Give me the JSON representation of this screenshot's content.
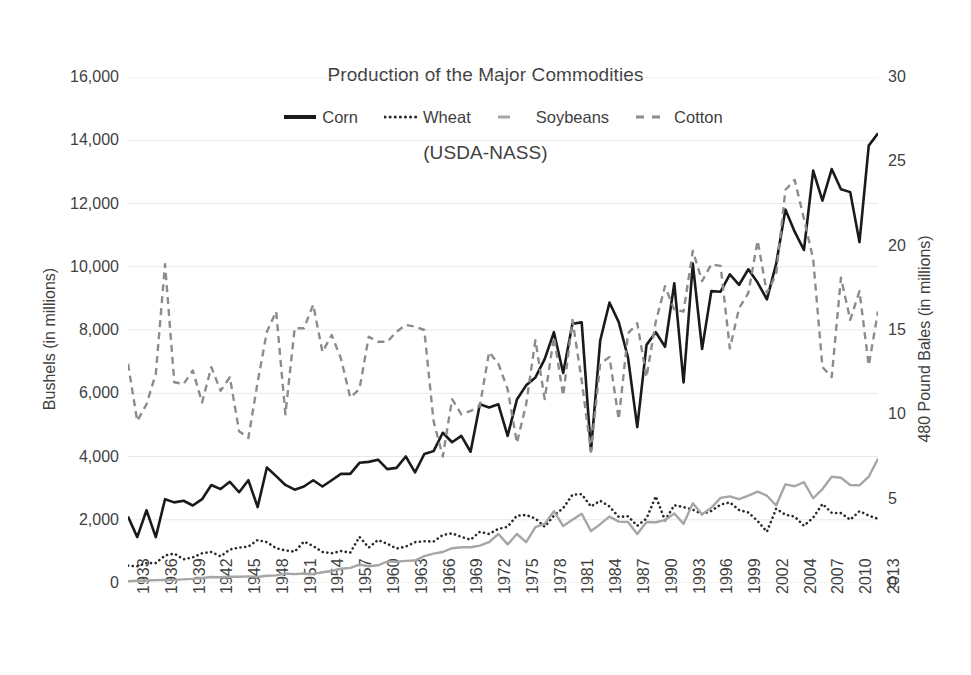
{
  "chart_data": {
    "type": "line",
    "title": "Production of the Major Commodities\n(USDA-NASS)",
    "title_line1": "Production of the Major Commodities",
    "title_line2": "(USDA-NASS)",
    "xlabel": "",
    "ylabel": "Bushels (in millions)",
    "y2label": "480 Pound Bales (in millions)",
    "ylim": [
      0,
      16000
    ],
    "y2lim": [
      0,
      30
    ],
    "yticks": [
      "0",
      "2,000",
      "4,000",
      "6,000",
      "8,000",
      "10,000",
      "12,000",
      "14,000",
      "16,000"
    ],
    "ytick_values": [
      0,
      2000,
      4000,
      6000,
      8000,
      10000,
      12000,
      14000,
      16000
    ],
    "y2ticks": [
      "0",
      "5",
      "10",
      "15",
      "20",
      "25",
      "30"
    ],
    "y2tick_values": [
      0,
      5,
      10,
      15,
      20,
      25,
      30
    ],
    "grid": true,
    "grid_color": "#e9e9e9",
    "legend_position": "top-center",
    "xlim": [
      1933,
      2014
    ],
    "xtick_labels": [
      "1933",
      "1936",
      "1939",
      "1942",
      "1945",
      "1948",
      "1951",
      "1954",
      "1957",
      "1960",
      "1963",
      "1966",
      "1969",
      "1972",
      "1975",
      "1978",
      "1981",
      "1984",
      "1987",
      "1990",
      "1993",
      "1996",
      "1999",
      "2002",
      "2004",
      "2007",
      "2010",
      "2013"
    ],
    "xtick_values": [
      1933,
      1936,
      1939,
      1942,
      1945,
      1948,
      1951,
      1954,
      1957,
      1960,
      1963,
      1966,
      1969,
      1972,
      1975,
      1978,
      1981,
      1984,
      1987,
      1990,
      1993,
      1996,
      1999,
      2002,
      2005,
      2008,
      2011,
      2014
    ],
    "x": [
      1933,
      1934,
      1935,
      1936,
      1937,
      1938,
      1939,
      1940,
      1941,
      1942,
      1943,
      1944,
      1945,
      1946,
      1947,
      1948,
      1949,
      1950,
      1951,
      1952,
      1953,
      1954,
      1955,
      1956,
      1957,
      1958,
      1959,
      1960,
      1961,
      1962,
      1963,
      1964,
      1965,
      1966,
      1967,
      1968,
      1969,
      1970,
      1971,
      1972,
      1973,
      1974,
      1975,
      1976,
      1977,
      1978,
      1979,
      1980,
      1981,
      1982,
      1983,
      1984,
      1985,
      1986,
      1987,
      1988,
      1989,
      1990,
      1991,
      1992,
      1993,
      1994,
      1995,
      1996,
      1997,
      1998,
      1999,
      2000,
      2001,
      2002,
      2003,
      2004,
      2005,
      2006,
      2007,
      2008,
      2009,
      2010,
      2011,
      2012,
      2013,
      2014
    ],
    "series": [
      {
        "name": "Corn",
        "axis": "left",
        "units": "Bushels (in millions)",
        "color": "#1a1a1a",
        "style": "solid",
        "width": 2.6,
        "values": [
          2100,
          1450,
          2300,
          1450,
          2650,
          2550,
          2600,
          2450,
          2650,
          3100,
          2970,
          3200,
          2870,
          3250,
          2400,
          3650,
          3380,
          3100,
          2950,
          3050,
          3250,
          3050,
          3250,
          3450,
          3450,
          3800,
          3830,
          3900,
          3600,
          3640,
          4000,
          3500,
          4080,
          4170,
          4750,
          4450,
          4650,
          4150,
          5650,
          5550,
          5650,
          4650,
          5800,
          6250,
          6500,
          7080,
          7930,
          6640,
          8200,
          8240,
          4170,
          7670,
          8870,
          8250,
          7130,
          4930,
          7530,
          7930,
          7470,
          9480,
          6340,
          10100,
          7400,
          9230,
          9210,
          9760,
          9430,
          9920,
          9500,
          8970,
          10090,
          11810,
          11110,
          10530,
          13040,
          12090,
          13090,
          12450,
          12360,
          10780,
          13830,
          14220
        ]
      },
      {
        "name": "Wheat",
        "axis": "left",
        "units": "Bushels (in millions)",
        "color": "#2a2a2a",
        "style": "dotted",
        "width": 2.6,
        "values": [
          550,
          530,
          630,
          630,
          870,
          930,
          750,
          810,
          940,
          980,
          840,
          1060,
          1120,
          1150,
          1360,
          1290,
          1100,
          1030,
          990,
          1310,
          1170,
          980,
          940,
          1010,
          960,
          1460,
          1120,
          1360,
          1240,
          1090,
          1150,
          1290,
          1320,
          1310,
          1520,
          1570,
          1460,
          1370,
          1620,
          1550,
          1710,
          1780,
          2130,
          2150,
          2040,
          1780,
          2130,
          2370,
          2790,
          2810,
          2420,
          2600,
          2420,
          2090,
          2110,
          1810,
          2040,
          2740,
          1980,
          2460,
          2400,
          2320,
          2180,
          2280,
          2480,
          2550,
          2310,
          2230,
          1960,
          1620,
          2350,
          2160,
          2100,
          1810,
          2070,
          2500,
          2220,
          2210,
          2000,
          2270,
          2130,
          2030
        ]
      },
      {
        "name": "Soybeans",
        "axis": "left",
        "units": "Bushels (in millions)",
        "color": "#a6a6a6",
        "style": "solid-light",
        "width": 2.4,
        "values": [
          55,
          70,
          80,
          90,
          95,
          100,
          115,
          130,
          160,
          190,
          180,
          200,
          200,
          210,
          190,
          230,
          240,
          300,
          280,
          300,
          280,
          340,
          380,
          450,
          480,
          580,
          530,
          560,
          680,
          670,
          700,
          710,
          850,
          930,
          980,
          1100,
          1130,
          1130,
          1180,
          1290,
          1550,
          1220,
          1550,
          1290,
          1770,
          1870,
          2270,
          1800,
          2000,
          2190,
          1640,
          1860,
          2100,
          1940,
          1930,
          1550,
          1930,
          1920,
          1990,
          2200,
          1870,
          2520,
          2170,
          2380,
          2690,
          2740,
          2650,
          2760,
          2890,
          2760,
          2450,
          3120,
          3060,
          3190,
          2680,
          2970,
          3360,
          3330,
          3100,
          3090,
          3360,
          3930
        ]
      },
      {
        "name": "Cotton",
        "axis": "right",
        "units": "480 Pound Bales (in millions)",
        "color": "#8c8c8c",
        "style": "dashed",
        "width": 2.4,
        "values": [
          13.0,
          9.6,
          10.6,
          12.4,
          18.9,
          11.9,
          11.8,
          12.6,
          10.7,
          12.8,
          11.4,
          12.2,
          9.0,
          8.6,
          11.9,
          14.9,
          16.1,
          10.0,
          15.1,
          15.1,
          16.5,
          13.7,
          14.7,
          13.3,
          11.0,
          11.5,
          14.6,
          14.3,
          14.3,
          14.9,
          15.3,
          15.2,
          15.0,
          9.6,
          7.5,
          10.9,
          10.0,
          10.2,
          10.5,
          13.7,
          13.0,
          11.5,
          8.3,
          10.6,
          14.4,
          10.9,
          14.6,
          11.1,
          15.6,
          12.0,
          7.8,
          13.0,
          13.4,
          9.7,
          14.8,
          15.4,
          12.2,
          15.5,
          17.6,
          16.2,
          16.1,
          19.7,
          17.9,
          18.9,
          18.8,
          13.9,
          16.3,
          17.2,
          20.3,
          17.2,
          18.3,
          23.3,
          23.9,
          21.6,
          19.2,
          12.8,
          12.2,
          18.1,
          15.6,
          17.3,
          12.9,
          16.1
        ]
      }
    ]
  },
  "legend": [
    {
      "label": "Corn",
      "swatch": "legend-swatch-corn"
    },
    {
      "label": "Wheat",
      "swatch": "legend-swatch-wheat"
    },
    {
      "label": "Soybeans",
      "swatch": "legend-swatch-soybeans"
    },
    {
      "label": "Cotton",
      "swatch": "legend-swatch-cotton"
    }
  ]
}
